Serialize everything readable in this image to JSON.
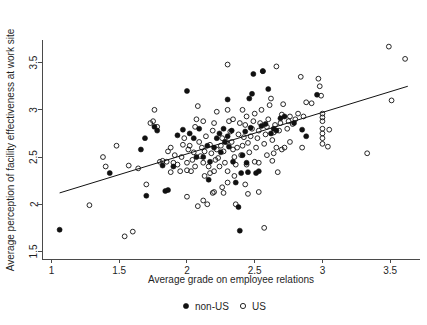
{
  "chart_data": {
    "type": "scatter",
    "title": "",
    "xlabel": "Average grade on employee relations",
    "ylabel": "Average perception of facility effectiveness at work site",
    "xlim": [
      0.93,
      3.72
    ],
    "ylim": [
      1.42,
      3.74
    ],
    "xticks": [
      1,
      1.5,
      2,
      2.5,
      3,
      3.5
    ],
    "xticklabels": [
      "1",
      "1.5",
      "2",
      "2.5",
      "3",
      "3.5"
    ],
    "yticks": [
      1.5,
      2,
      2.5,
      3,
      3.5
    ],
    "yticklabels": [
      "1.5",
      "2",
      "2.5",
      "3",
      "3.5"
    ],
    "grid": false,
    "legend_position": "bottom",
    "legend": [
      {
        "name": "non-US",
        "marker": "filled-circle",
        "color": "#111111"
      },
      {
        "name": "US",
        "marker": "open-circle",
        "color": "#111111"
      }
    ],
    "trendline": {
      "label": "linear fit",
      "x": [
        1.06,
        3.63
      ],
      "y": [
        2.12,
        3.25
      ]
    },
    "series": [
      {
        "name": "non-US",
        "marker": "filled-circle",
        "points": [
          [
            1.06,
            1.73
          ],
          [
            1.43,
            2.33
          ],
          [
            1.69,
            2.7
          ],
          [
            1.66,
            2.58
          ],
          [
            1.7,
            2.09
          ],
          [
            1.78,
            2.78
          ],
          [
            1.76,
            2.82
          ],
          [
            1.84,
            2.14
          ],
          [
            1.86,
            2.15
          ],
          [
            1.82,
            2.41
          ],
          [
            1.9,
            2.4
          ],
          [
            1.93,
            2.73
          ],
          [
            1.97,
            2.79
          ],
          [
            2.0,
            3.2
          ],
          [
            2.02,
            2.75
          ],
          [
            2.05,
            2.7
          ],
          [
            2.07,
            2.5
          ],
          [
            2.09,
            2.8
          ],
          [
            2.12,
            2.5
          ],
          [
            2.15,
            2.62
          ],
          [
            2.17,
            2.45
          ],
          [
            2.16,
            2.26
          ],
          [
            2.2,
            2.6
          ],
          [
            2.22,
            2.7
          ],
          [
            2.24,
            2.75
          ],
          [
            2.25,
            2.55
          ],
          [
            2.27,
            2.8
          ],
          [
            2.28,
            2.66
          ],
          [
            2.3,
            2.72
          ],
          [
            2.31,
            2.61
          ],
          [
            2.33,
            2.78
          ],
          [
            2.34,
            2.45
          ],
          [
            2.36,
            2.23
          ],
          [
            2.38,
            1.97
          ],
          [
            2.39,
            1.72
          ],
          [
            2.4,
            2.33
          ],
          [
            2.41,
            2.52
          ],
          [
            2.43,
            2.77
          ],
          [
            2.44,
            2.44
          ],
          [
            2.45,
            2.34
          ],
          [
            2.47,
            2.81
          ],
          [
            2.48,
            3.17
          ],
          [
            2.49,
            3.38
          ],
          [
            2.51,
            2.33
          ],
          [
            2.53,
            2.35
          ],
          [
            2.55,
            2.83
          ],
          [
            2.56,
            3.41
          ],
          [
            2.58,
            2.85
          ],
          [
            2.6,
            3.22
          ],
          [
            2.62,
            2.75
          ],
          [
            2.64,
            2.8
          ],
          [
            2.66,
            2.78
          ],
          [
            2.69,
            2.91
          ],
          [
            2.72,
            2.93
          ],
          [
            2.79,
            2.86
          ],
          [
            2.85,
            2.79
          ],
          [
            2.88,
            2.72
          ],
          [
            2.96,
            3.16
          ],
          [
            2.3,
            3.11
          ],
          [
            2.46,
            3.12
          ]
        ]
      },
      {
        "name": "US",
        "marker": "open-circle",
        "points": [
          [
            1.28,
            1.99
          ],
          [
            1.38,
            2.5
          ],
          [
            1.4,
            2.4
          ],
          [
            1.48,
            2.62
          ],
          [
            1.54,
            1.66
          ],
          [
            1.57,
            2.41
          ],
          [
            1.6,
            1.71
          ],
          [
            1.64,
            2.38
          ],
          [
            1.7,
            2.21
          ],
          [
            1.73,
            2.86
          ],
          [
            1.75,
            2.88
          ],
          [
            1.76,
            3.0
          ],
          [
            1.78,
            2.82
          ],
          [
            1.8,
            2.45
          ],
          [
            1.82,
            2.46
          ],
          [
            1.85,
            2.45
          ],
          [
            1.86,
            2.56
          ],
          [
            1.88,
            2.6
          ],
          [
            1.9,
            2.44
          ],
          [
            1.91,
            2.52
          ],
          [
            1.93,
            2.42
          ],
          [
            1.95,
            2.35
          ],
          [
            1.96,
            2.5
          ],
          [
            1.97,
            2.63
          ],
          [
            1.98,
            2.7
          ],
          [
            2.0,
            2.08
          ],
          [
            2.0,
            2.44
          ],
          [
            2.01,
            2.58
          ],
          [
            2.02,
            2.62
          ],
          [
            2.03,
            2.35
          ],
          [
            2.04,
            2.47
          ],
          [
            2.05,
            2.55
          ],
          [
            2.06,
            2.82
          ],
          [
            2.07,
            2.9
          ],
          [
            2.08,
            3.04
          ],
          [
            2.09,
            2.66
          ],
          [
            2.1,
            2.51
          ],
          [
            2.11,
            2.6
          ],
          [
            2.12,
            2.44
          ],
          [
            2.13,
            2.56
          ],
          [
            2.14,
            2.72
          ],
          [
            2.15,
            2.0
          ],
          [
            2.16,
            2.4
          ],
          [
            2.17,
            2.63
          ],
          [
            2.18,
            2.54
          ],
          [
            2.19,
            2.78
          ],
          [
            2.2,
            2.86
          ],
          [
            2.21,
            2.47
          ],
          [
            2.22,
            2.58
          ],
          [
            2.23,
            2.49
          ],
          [
            2.24,
            2.4
          ],
          [
            2.25,
            2.62
          ],
          [
            2.26,
            2.7
          ],
          [
            2.27,
            2.56
          ],
          [
            2.28,
            2.44
          ],
          [
            2.29,
            2.66
          ],
          [
            2.3,
            3.48
          ],
          [
            2.3,
            3.0
          ],
          [
            2.31,
            2.88
          ],
          [
            2.32,
            2.77
          ],
          [
            2.33,
            2.66
          ],
          [
            2.34,
            2.58
          ],
          [
            2.35,
            2.5
          ],
          [
            2.36,
            2.42
          ],
          [
            2.37,
            2.6
          ],
          [
            2.38,
            2.74
          ],
          [
            2.39,
            2.86
          ],
          [
            2.4,
            2.52
          ],
          [
            2.41,
            2.62
          ],
          [
            2.42,
            2.71
          ],
          [
            2.43,
            2.84
          ],
          [
            2.44,
            2.93
          ],
          [
            2.45,
            2.65
          ],
          [
            2.46,
            2.55
          ],
          [
            2.47,
            2.72
          ],
          [
            2.48,
            2.8
          ],
          [
            2.49,
            2.88
          ],
          [
            2.5,
            2.96
          ],
          [
            2.51,
            2.6
          ],
          [
            2.52,
            2.7
          ],
          [
            2.53,
            2.78
          ],
          [
            2.54,
            2.86
          ],
          [
            2.55,
            3.0
          ],
          [
            2.56,
            3.41
          ],
          [
            2.57,
            2.64
          ],
          [
            2.58,
            2.74
          ],
          [
            2.59,
            2.82
          ],
          [
            2.6,
            2.9
          ],
          [
            2.61,
            3.05
          ],
          [
            2.62,
            3.12
          ],
          [
            2.63,
            2.68
          ],
          [
            2.64,
            2.76
          ],
          [
            2.65,
            2.84
          ],
          [
            2.66,
            3.46
          ],
          [
            2.67,
            2.34
          ],
          [
            2.68,
            2.78
          ],
          [
            2.69,
            2.86
          ],
          [
            2.7,
            2.95
          ],
          [
            2.71,
            3.06
          ],
          [
            2.72,
            2.6
          ],
          [
            2.74,
            2.8
          ],
          [
            2.75,
            2.88
          ],
          [
            2.76,
            2.93
          ],
          [
            2.78,
            2.85
          ],
          [
            2.8,
            2.9
          ],
          [
            2.82,
            2.96
          ],
          [
            2.84,
            3.35
          ],
          [
            2.86,
            2.93
          ],
          [
            2.88,
            3.08
          ],
          [
            2.92,
            3.07
          ],
          [
            2.97,
            3.33
          ],
          [
            2.98,
            3.25
          ],
          [
            2.99,
            3.15
          ],
          [
            3.0,
            2.96
          ],
          [
            3.0,
            2.92
          ],
          [
            3.0,
            2.88
          ],
          [
            3.0,
            2.8
          ],
          [
            3.0,
            2.75
          ],
          [
            3.0,
            2.7
          ],
          [
            3.0,
            2.64
          ],
          [
            3.05,
            2.79
          ],
          [
            3.04,
            2.61
          ],
          [
            3.33,
            2.54
          ],
          [
            3.49,
            3.67
          ],
          [
            3.51,
            3.1
          ],
          [
            3.61,
            3.54
          ],
          [
            2.12,
            2.04
          ],
          [
            2.19,
            2.12
          ],
          [
            2.2,
            2.13
          ],
          [
            2.17,
            2.33
          ],
          [
            2.26,
            2.18
          ],
          [
            2.27,
            2.12
          ],
          [
            2.3,
            2.23
          ],
          [
            2.36,
            2.0
          ],
          [
            2.45,
            2.11
          ],
          [
            2.53,
            2.13
          ],
          [
            2.57,
            1.75
          ],
          [
            2.08,
            1.98
          ],
          [
            2.3,
            2.35
          ],
          [
            2.66,
            2.6
          ],
          [
            2.7,
            2.58
          ],
          [
            2.43,
            2.21
          ],
          [
            1.88,
            2.34
          ],
          [
            2.0,
            2.36
          ],
          [
            2.35,
            2.3
          ],
          [
            2.44,
            2.42
          ],
          [
            2.63,
            2.46
          ],
          [
            2.76,
            2.66
          ],
          [
            2.85,
            2.6
          ],
          [
            2.2,
            2.35
          ],
          [
            2.13,
            2.3
          ],
          [
            2.06,
            2.4
          ],
          [
            2.5,
            2.45
          ],
          [
            2.59,
            2.52
          ],
          [
            2.34,
            2.9
          ],
          [
            2.41,
            3.0
          ],
          [
            2.53,
            2.44
          ],
          [
            2.64,
            2.54
          ],
          [
            2.22,
            2.98
          ],
          [
            2.12,
            2.88
          ]
        ]
      }
    ]
  }
}
